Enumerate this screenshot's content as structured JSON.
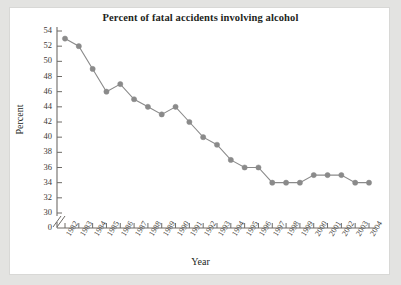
{
  "chart_data": {
    "type": "line",
    "title": "Percent of fatal accidents involving alcohol",
    "xlabel": "Year",
    "ylabel": "Percent",
    "grid": false,
    "legend": "none",
    "axis_break": true,
    "axis_break_note": "y-axis broken between 0 and 30",
    "ylim": [
      30,
      54
    ],
    "ytick_labels": [
      "54",
      "52",
      "50",
      "48",
      "46",
      "44",
      "42",
      "40",
      "38",
      "36",
      "34",
      "32",
      "30",
      "0"
    ],
    "yticks": [
      54,
      52,
      50,
      48,
      46,
      44,
      42,
      40,
      38,
      36,
      34,
      32,
      30,
      0
    ],
    "categories": [
      "1982",
      "1983",
      "1984",
      "1985",
      "1986",
      "1987",
      "1988",
      "1989",
      "1990",
      "1991",
      "1992",
      "1993",
      "1994",
      "1995",
      "1996",
      "1997",
      "1998",
      "1999",
      "2000",
      "2001",
      "2002",
      "2003",
      "2004"
    ],
    "x": [
      1982,
      1983,
      1984,
      1985,
      1986,
      1987,
      1988,
      1989,
      1990,
      1991,
      1992,
      1993,
      1994,
      1995,
      1996,
      1997,
      1998,
      1999,
      2000,
      2001,
      2002,
      2003,
      2004
    ],
    "values": [
      53,
      52,
      49,
      46,
      47,
      45,
      44,
      43,
      44,
      42,
      40,
      39,
      37,
      36,
      36,
      34,
      34,
      34,
      35,
      35,
      35,
      34,
      34
    ],
    "series": [
      {
        "name": "Percent of fatal accidents involving alcohol",
        "values": [
          53,
          52,
          49,
          46,
          47,
          45,
          44,
          43,
          44,
          42,
          40,
          39,
          37,
          36,
          36,
          34,
          34,
          34,
          35,
          35,
          35,
          34,
          34
        ]
      }
    ]
  },
  "style": {
    "line_color": "#8a8a8a",
    "marker_color": "#8a8a8a",
    "axis_color": "#6e6b67",
    "text_color": "#231f1c",
    "panel_background": "#ffffff",
    "page_background": "#e3e3e1"
  }
}
